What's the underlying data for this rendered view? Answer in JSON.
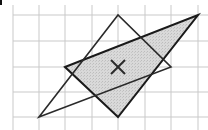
{
  "diagram": {
    "width": 208,
    "height": 130,
    "grid": {
      "color": "#c9c9c9",
      "vertical_lines_x": [
        13,
        39,
        65,
        92,
        118,
        145,
        171,
        198
      ],
      "horizontal_lines_y": [
        15,
        41,
        67,
        92,
        117
      ],
      "extent": {
        "x_min": 13,
        "x_max": 208,
        "y_min": 5,
        "y_max": 130
      }
    },
    "shapes": [
      {
        "name": "outline-triangle",
        "points": [
          [
            39,
            117
          ],
          [
            118,
            15
          ],
          [
            171,
            67
          ]
        ],
        "fill": "none",
        "stroke": "#2a2a2a",
        "stroke_width": 1.6
      },
      {
        "name": "shaded-triangle",
        "points": [
          [
            65,
            67
          ],
          [
            198,
            15
          ],
          [
            118,
            117
          ]
        ],
        "fill": "#d6d6d6",
        "stroke": "#1a1a1a",
        "stroke_width": 2
      }
    ],
    "center_mark": {
      "symbol": "cross",
      "x": 118,
      "y": 67,
      "size": 14,
      "color": "#2a2a2a"
    },
    "colors": {
      "background": "#ffffff",
      "corner_mark": "#111111"
    }
  }
}
